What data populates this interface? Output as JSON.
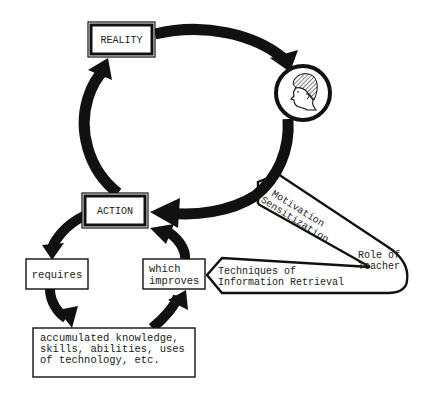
{
  "diagram": {
    "type": "cycle-flow",
    "colors": {
      "ink": "#111111",
      "paper": "#ffffff",
      "hair_hatch": "#555555"
    },
    "nodes": {
      "reality": {
        "label": "REALITY"
      },
      "person": {
        "icon": "person-head-icon"
      },
      "action": {
        "label": "ACTION"
      },
      "requires": {
        "label": "requires"
      },
      "which_improves": {
        "line1": "which",
        "line2": "improves"
      },
      "knowledge": {
        "line1": "accumulated knowledge,",
        "line2": "skills, abilities, uses",
        "line3": "of technology, etc."
      },
      "teacher": {
        "line1": "Role of",
        "line2": "Teacher",
        "branch_upper": {
          "line1": "Motivation",
          "line2": "Sensitization"
        },
        "branch_lower": {
          "line1": "Techniques of",
          "line2": "Information Retrieval"
        }
      }
    },
    "edges": [
      {
        "from": "reality",
        "to": "person"
      },
      {
        "from": "person",
        "to": "action"
      },
      {
        "from": "action",
        "to": "reality"
      },
      {
        "from": "action",
        "to": "requires"
      },
      {
        "from": "requires",
        "to": "knowledge"
      },
      {
        "from": "knowledge",
        "to": "which_improves"
      },
      {
        "from": "which_improves",
        "to": "action"
      }
    ]
  }
}
